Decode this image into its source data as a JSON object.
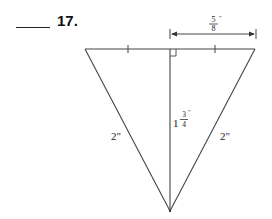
{
  "problem": {
    "number_label": "17.",
    "answer_blank": ""
  },
  "figure": {
    "type": "isosceles triangle with altitude",
    "vertices": {
      "top_left": [
        85,
        49
      ],
      "top_right": [
        255,
        49
      ],
      "bottom": [
        170,
        211
      ]
    },
    "altitude": {
      "from": [
        170,
        49
      ],
      "to": [
        170,
        211
      ]
    },
    "labels": {
      "half_base": {
        "numerator": "5",
        "denominator": "8",
        "unit": "\""
      },
      "height": {
        "whole": "1",
        "numerator": "3",
        "denominator": "4",
        "unit": "\""
      },
      "left_side": "2\"",
      "right_side": "2\""
    },
    "line_color": "#444444"
  }
}
